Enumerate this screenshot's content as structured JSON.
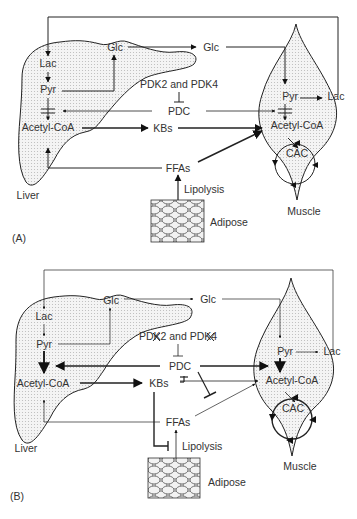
{
  "panels": [
    {
      "id": "A",
      "caption": "(A)",
      "organs": {
        "liver": "Liver",
        "muscle": "Muscle",
        "adipose": "Adipose"
      },
      "liver_nodes": {
        "lac": "Lac",
        "pyr": "Pyr",
        "glc": "Glc",
        "acetyl": "Acetyl-CoA"
      },
      "muscle_nodes": {
        "pyr": "Pyr",
        "lac": "Lac",
        "acetyl": "Acetyl-CoA",
        "cac": "CAC"
      },
      "mid": {
        "glc": "Glc",
        "pdk": "PDK2 and PDK4",
        "pdc": "PDC",
        "kbs": "KBs",
        "ffas": "FFAs",
        "lipolysis": "Lipolysis"
      }
    },
    {
      "id": "B",
      "caption": "(B)",
      "organs": {
        "liver": "Liver",
        "muscle": "Muscle",
        "adipose": "Adipose"
      },
      "liver_nodes": {
        "lac": "Lac",
        "pyr": "Pyr",
        "glc": "Glc",
        "acetyl": "Acetyl-CoA"
      },
      "muscle_nodes": {
        "pyr": "Pyr",
        "lac": "Lac",
        "acetyl": "Acetyl-CoA",
        "cac": "CAC"
      },
      "mid": {
        "glc": "Glc",
        "pdk": "PDK2 and PDK4",
        "pdc": "PDC",
        "kbs": "KBs",
        "ffas": "FFAs",
        "lipolysis": "Lipolysis"
      }
    }
  ]
}
